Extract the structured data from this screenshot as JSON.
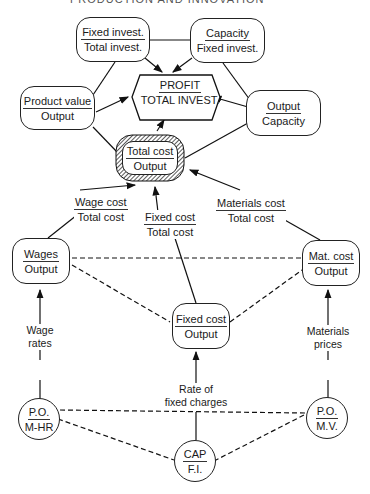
{
  "header": {
    "partial_title": "PRODUCTION AND INNOVATION"
  },
  "center": {
    "num": "PROFIT",
    "den": "TOTAL INVEST."
  },
  "nodes": {
    "fixed_total": {
      "num": "Fixed invest.",
      "den": "Total invest."
    },
    "capacity_fixed": {
      "num": "Capacity",
      "den": "Fixed invest."
    },
    "product_value": {
      "num": "Product value",
      "den": "Output"
    },
    "output_capacity": {
      "num": "Output",
      "den": "Capacity"
    },
    "total_cost": {
      "num": "Total cost",
      "den": "Output"
    },
    "wages": {
      "num": "Wages",
      "den": "Output"
    },
    "mat_cost": {
      "num": "Mat. cost",
      "den": "Output"
    },
    "fixed_cost": {
      "num": "Fixed cost",
      "den": "Output"
    },
    "po_mhr": {
      "num": "P.O.",
      "den": "M-HR"
    },
    "po_mv": {
      "num": "P.O.",
      "den": "M.V."
    },
    "cap_fi": {
      "num": "CAP",
      "den": "F.I."
    }
  },
  "labels": {
    "wage_cost": {
      "num": "Wage cost",
      "den": "Total cost"
    },
    "fixed_cost_total": {
      "num": "Fixed cost",
      "den": "Total cost"
    },
    "materials_cost": {
      "num": "Materials cost",
      "den": "Total cost"
    },
    "wage_rates": {
      "l1": "Wage",
      "l2": "rates"
    },
    "materials_prices": {
      "l1": "Materials",
      "l2": "prices"
    },
    "rate_fixed": {
      "l1": "Rate of",
      "l2": "fixed charges"
    }
  }
}
